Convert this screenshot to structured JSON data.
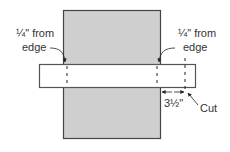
{
  "diagram": {
    "type": "cut-layout",
    "colors": {
      "panel_fill": "#cfcfcf",
      "panel_stroke": "#444444",
      "board_fill": "#ffffff",
      "board_stroke": "#555555",
      "line": "#222222",
      "text": "#333333"
    },
    "labels": {
      "left_mark_line1": "¼\" from",
      "left_mark_line2": "edge",
      "right_mark_line1": "¼\" from",
      "right_mark_line2": "edge",
      "dimension": "3½\"",
      "cut": "Cut"
    }
  }
}
